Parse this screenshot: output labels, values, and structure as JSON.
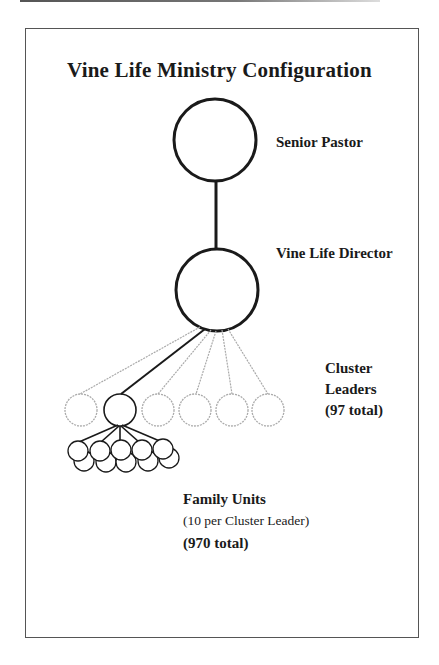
{
  "title": "Vine Life Ministry Configuration",
  "levels": {
    "senior_pastor": {
      "label": "Senior Pastor"
    },
    "director": {
      "label": "Vine Life Director"
    },
    "cluster_leaders": {
      "line1": "Cluster",
      "line2": "Leaders",
      "total": "(97 total)"
    },
    "family_units": {
      "label": "Family Units",
      "ratio": "(10 per Cluster Leader)",
      "total": "(970 total)"
    }
  },
  "diagram": {
    "type": "hierarchy",
    "nodes": [
      {
        "id": "senior-pastor",
        "count": 1
      },
      {
        "id": "vine-life-director",
        "count": 1,
        "parent": "senior-pastor"
      },
      {
        "id": "cluster-leaders",
        "count_shown": 6,
        "total": 97,
        "parent": "vine-life-director"
      },
      {
        "id": "family-units",
        "count_shown": 10,
        "per_parent": 10,
        "total": 970,
        "parent": "cluster-leaders"
      }
    ]
  },
  "colors": {
    "solid_stroke": "#1a1a1a",
    "faded_stroke": "#aaaaaa",
    "frame": "#555555"
  }
}
